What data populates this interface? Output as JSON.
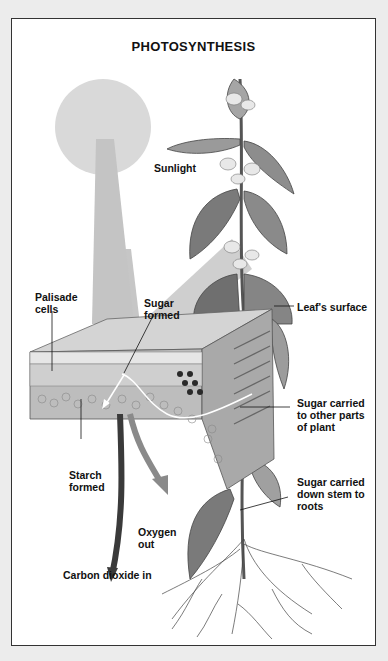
{
  "diagram": {
    "title": "PHOTOSYNTHESIS",
    "labels": {
      "sunlight": "Sunlight",
      "palisade_cells": "Palisade\ncells",
      "sugar_formed": "Sugar\nformed",
      "leaf_surface": "Leaf's surface",
      "sugar_to_other_parts": "Sugar carried\nto other parts\nof plant",
      "starch_formed": "Starch\nformed",
      "sugar_down_stem": "Sugar carried\ndown stem to\nroots",
      "oxygen_out": "Oxygen\nout",
      "carbon_dioxide_in": "Carbon dioxide in"
    },
    "colors": {
      "background": "#ececec",
      "frame": "#ffffff",
      "sun": "#d9d9d9",
      "beam": "#c4c4c4",
      "text": "#111111",
      "oxygen_arrow": "#8a8a8a",
      "co2_arrow": "#3a3a3a"
    }
  }
}
